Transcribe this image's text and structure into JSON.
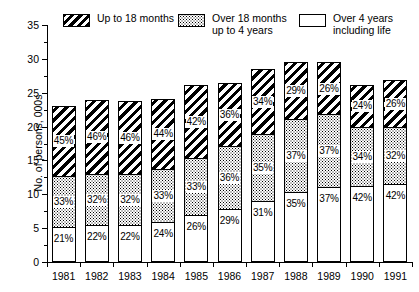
{
  "chart_data": {
    "type": "bar",
    "subtype": "stacked-bar",
    "title": "",
    "xlabel": "",
    "ylabel": "No. of persons, 000s",
    "ylim": [
      0,
      35
    ],
    "ytick_step": 5,
    "yticks": [
      0,
      5,
      10,
      15,
      20,
      25,
      30,
      35
    ],
    "ytick_labels": [
      "0",
      "5",
      "10",
      "15",
      "20",
      "25",
      "30",
      "35"
    ],
    "yminor_step": 2.5,
    "grid": false,
    "legend_position": "top",
    "categories": [
      "1981",
      "1982",
      "1983",
      "1984",
      "1985",
      "1986",
      "1987",
      "1988",
      "1989",
      "1990",
      "1991"
    ],
    "series": [
      {
        "name": "Up to 18 months",
        "pattern": "diagonal-hatch",
        "stack_order": "top",
        "values": [
          10.5,
          11.0,
          11.0,
          10.5,
          10.9,
          9.4,
          9.7,
          8.5,
          7.7,
          6.3,
          7.0
        ],
        "percent_labels": [
          "45%",
          "46%",
          "46%",
          "44%",
          "42%",
          "36%",
          "34%",
          "29%",
          "26%",
          "24%",
          "26%"
        ]
      },
      {
        "name": "Over 18 months up to 4 years",
        "pattern": "dotted",
        "stack_order": "middle",
        "values": [
          7.7,
          7.6,
          7.6,
          7.9,
          8.6,
          9.4,
          10.0,
          10.8,
          10.9,
          8.9,
          8.6
        ]
      },
      {
        "name": "Over 4 years including life",
        "pattern": "plain-white",
        "stack_order": "bottom",
        "values": [
          4.9,
          5.3,
          5.2,
          5.7,
          6.7,
          7.6,
          8.8,
          10.2,
          10.9,
          11.0,
          11.3
        ]
      }
    ],
    "series_percent_labels": {
      "Up to 18 months": [
        "45%",
        "46%",
        "46%",
        "44%",
        "42%",
        "36%",
        "34%",
        "29%",
        "26%",
        "24%",
        "26%"
      ],
      "Over 18 months up to 4 years": [
        "33%",
        "32%",
        "32%",
        "33%",
        "33%",
        "36%",
        "35%",
        "37%",
        "37%",
        "34%",
        "32%"
      ],
      "Over 4 years including life": [
        "21%",
        "22%",
        "22%",
        "24%",
        "26%",
        "29%",
        "31%",
        "35%",
        "37%",
        "42%",
        "42%"
      ]
    },
    "totals": [
      23.1,
      23.9,
      23.8,
      24.1,
      26.2,
      26.4,
      28.5,
      29.5,
      29.5,
      26.2,
      26.9
    ]
  },
  "legend": {
    "entries": [
      {
        "label": "Up to 18 months",
        "pattern": "diagonal-hatch"
      },
      {
        "label": "Over 18 months\nup to 4 years",
        "pattern": "dotted"
      },
      {
        "label": "Over 4 years\nincluding life",
        "pattern": "plain-white"
      }
    ]
  }
}
